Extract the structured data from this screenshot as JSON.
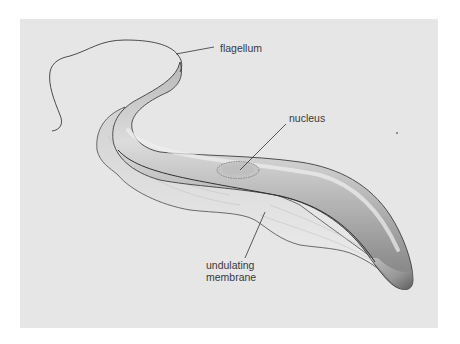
{
  "figure": {
    "background_color": "#e6e6e6",
    "labels": {
      "flagellum": "flagellum",
      "nucleus": "nucleus",
      "membrane_line1": "undulating",
      "membrane_line2": "membrane"
    }
  }
}
